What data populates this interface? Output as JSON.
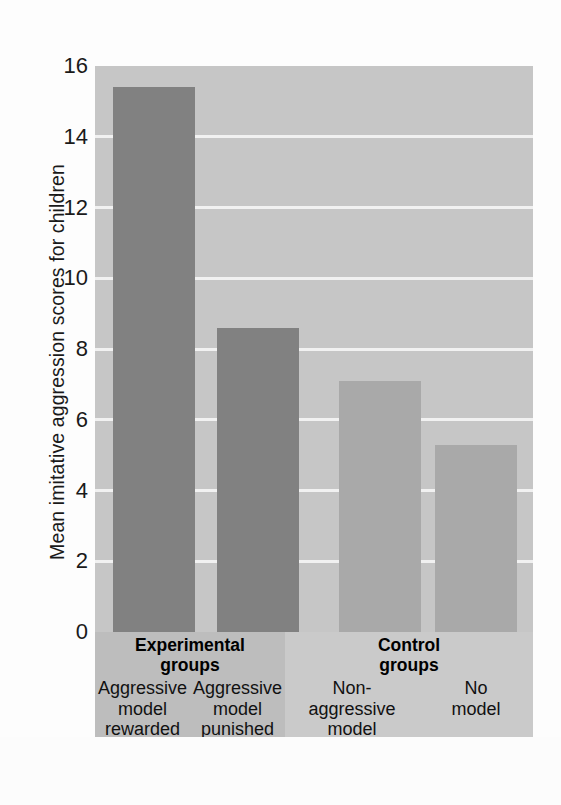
{
  "chart_data": {
    "type": "bar",
    "title": "",
    "xlabel": "",
    "ylabel": "Mean imitative aggression scores for children",
    "ylim": [
      0,
      16
    ],
    "yticks": [
      0,
      2,
      4,
      6,
      8,
      10,
      12,
      14,
      16
    ],
    "ytick_labels": [
      "0",
      "2",
      "4",
      "6",
      "8",
      "10",
      "12",
      "14",
      "16"
    ],
    "grid": true,
    "legend": "none",
    "categories": [
      "Aggressive model rewarded",
      "Aggressive model punished",
      "Non-aggressive model",
      "No model"
    ],
    "values": [
      15.4,
      8.6,
      7.1,
      5.3
    ],
    "bar_colors": [
      "#818181",
      "#818181",
      "#a9a9a9",
      "#a9a9a9"
    ],
    "groups": [
      {
        "name": "Experimental groups",
        "categories": [
          "Aggressive model rewarded",
          "Aggressive model punished"
        ]
      },
      {
        "name": "Control groups",
        "categories": [
          "Non-aggressive model",
          "No model"
        ]
      }
    ]
  },
  "axis": {
    "y_title": "Mean imitative aggression scores for children",
    "ticks": [
      {
        "label": "16",
        "value": 16
      },
      {
        "label": "14",
        "value": 14
      },
      {
        "label": "12",
        "value": 12
      },
      {
        "label": "10",
        "value": 10
      },
      {
        "label": "8",
        "value": 8
      },
      {
        "label": "6",
        "value": 6
      },
      {
        "label": "4",
        "value": 4
      },
      {
        "label": "2",
        "value": 2
      },
      {
        "label": "0",
        "value": 0
      }
    ]
  },
  "labels": {
    "experimental_title_line1": "Experimental",
    "experimental_title_line2": "groups",
    "control_title_line1": "Control",
    "control_title_line2": "groups",
    "cat1_line1": "Aggressive",
    "cat1_line2": "model",
    "cat1_line3": "rewarded",
    "cat2_line1": "Aggressive",
    "cat2_line2": "model",
    "cat2_line3": "punished",
    "cat3_line1": "Non-",
    "cat3_line2": "aggressive",
    "cat3_line3": "model",
    "cat4_line1": "No",
    "cat4_line2": "model",
    "cat4_line3": ""
  },
  "colors": {
    "plot_background": "#c6c6c6",
    "bar_dark": "#818181",
    "bar_light": "#a9a9a9",
    "gridline": "#f4f4f4",
    "band_experimental": "#bdbdbd",
    "band_control": "#cacaca",
    "text": "#111111"
  }
}
